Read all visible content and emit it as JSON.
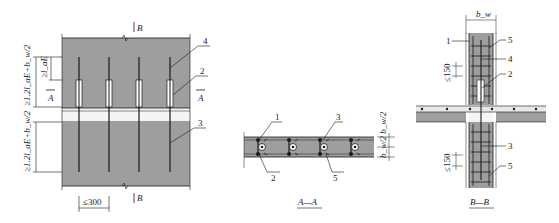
{
  "figure": {
    "colors": {
      "concrete": "#9e9e9e",
      "line": "#1a1a1a",
      "background": "#ffffff"
    },
    "elevation": {
      "section_marker_top": "B",
      "section_marker_bottom": "B",
      "section_marker_left": "A",
      "section_marker_right": "A",
      "dim_upper": "≥1.2l_aE+b_w/2",
      "dim_lap": "≥l_aE",
      "dim_lower": "≥1.2l_aE+b_w/2",
      "dim_spacing": "≤300",
      "callouts": [
        "4",
        "2",
        "3"
      ]
    },
    "section_aa": {
      "title": "A—A",
      "callouts": [
        "1",
        "3",
        "2",
        "5"
      ],
      "dim_right": "b_w/2 b_w/2"
    },
    "section_bb": {
      "title": "B—B",
      "dim_width": "b_w",
      "dim_upper_spacing": "≤150",
      "dim_lower_spacing": "≤150",
      "callouts": [
        "1",
        "5",
        "4",
        "2",
        "3",
        "5"
      ]
    }
  }
}
